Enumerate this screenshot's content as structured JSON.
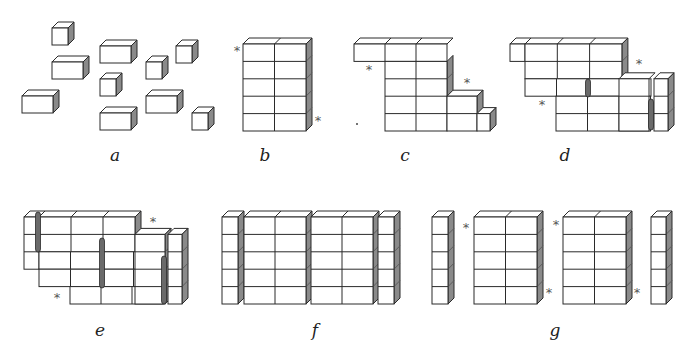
{
  "style": {
    "stroke": "#2a2a2a",
    "face": "#ffffff",
    "top": "#ffffff",
    "side": "#8a8a8a",
    "side_dark": "#5c5c5c",
    "rod": "#6a6a6a",
    "depth_dx": 6,
    "depth_dy": 6,
    "cell_w": 31,
    "cell_h": 17.4
  },
  "panels": [
    {
      "id": "a",
      "label": "a",
      "label_pos": [
        115,
        155
      ]
    },
    {
      "id": "b",
      "label": "b",
      "label_pos": [
        265,
        155
      ]
    },
    {
      "id": "c",
      "label": "c",
      "label_pos": [
        405,
        155
      ]
    },
    {
      "id": "d",
      "label": "d",
      "label_pos": [
        565,
        155
      ]
    },
    {
      "id": "e",
      "label": "e",
      "label_pos": [
        100,
        330
      ]
    },
    {
      "id": "f",
      "label": "f",
      "label_pos": [
        315,
        330
      ]
    },
    {
      "id": "g",
      "label": "g",
      "label_pos": [
        555,
        330
      ]
    }
  ],
  "loose_boxes_a": [
    {
      "x": 52,
      "y": 28,
      "w": 16,
      "h": 17
    },
    {
      "x": 100,
      "y": 46,
      "w": 31,
      "h": 17
    },
    {
      "x": 176,
      "y": 46,
      "w": 16,
      "h": 17
    },
    {
      "x": 52,
      "y": 62,
      "w": 31,
      "h": 17
    },
    {
      "x": 146,
      "y": 62,
      "w": 16,
      "h": 17
    },
    {
      "x": 100,
      "y": 79,
      "w": 16,
      "h": 17
    },
    {
      "x": 22,
      "y": 96,
      "w": 31,
      "h": 17
    },
    {
      "x": 146,
      "y": 96,
      "w": 31,
      "h": 17
    },
    {
      "x": 100,
      "y": 113,
      "w": 31,
      "h": 17
    },
    {
      "x": 192,
      "y": 113,
      "w": 16,
      "h": 17
    }
  ],
  "blocks": {
    "b": [
      {
        "x": 243,
        "y": 44,
        "cols": 2,
        "rows": 5,
        "cw": 31.5,
        "ch": 17.4
      }
    ],
    "c": [
      {
        "x": 354,
        "y": 44,
        "cols": 3,
        "rows": 1,
        "cw": 31,
        "ch": 17.4,
        "noside": true
      },
      {
        "x": 385,
        "y": 61.4,
        "cols": 2,
        "rows": 4,
        "cw": 31,
        "ch": 17.4,
        "notop": true
      },
      {
        "x": 447,
        "y": 96.2,
        "cols": 1,
        "rows": 2,
        "cw": 30,
        "ch": 17.4
      },
      {
        "x": 477,
        "y": 113.6,
        "cols": 1,
        "rows": 1,
        "cw": 13,
        "ch": 17.4
      }
    ],
    "d": [
      {
        "x": 510,
        "y": 44,
        "cols": 1,
        "rows": 1,
        "cw": 15,
        "ch": 17.4,
        "noside": true
      },
      {
        "x": 525,
        "y": 44,
        "cols": 3,
        "rows": 2,
        "cw": 32.3,
        "ch": 17.4
      },
      {
        "x": 525,
        "y": 78.8,
        "cols": 4,
        "rows": 1,
        "cw": 31.5,
        "ch": 17.4,
        "notop": true,
        "noside": true
      },
      {
        "x": 556,
        "y": 96.2,
        "cols": 3,
        "rows": 2,
        "cw": 31.5,
        "ch": 17.4,
        "notop": true,
        "noside": true
      },
      {
        "x": 619,
        "y": 78.8,
        "cols": 1,
        "rows": 3,
        "cw": 30,
        "ch": 17.4,
        "noside": true
      },
      {
        "x": 654,
        "y": 78.8,
        "cols": 1,
        "rows": 3,
        "cw": 14,
        "ch": 17.4
      }
    ],
    "e": [
      {
        "x": 24,
        "y": 217,
        "cols": 1,
        "rows": 3,
        "cw": 15,
        "ch": 17.4,
        "noside": true
      },
      {
        "x": 39,
        "y": 217,
        "cols": 3,
        "rows": 2,
        "cw": 32,
        "ch": 17.4
      },
      {
        "x": 39,
        "y": 251.8,
        "cols": 4,
        "rows": 1,
        "cw": 31.5,
        "ch": 17.4,
        "notop": true,
        "noside": true
      },
      {
        "x": 39,
        "y": 269.2,
        "cols": 4,
        "rows": 1,
        "cw": 31.5,
        "ch": 17.4,
        "notop": true,
        "noside": true
      },
      {
        "x": 70,
        "y": 286.6,
        "cols": 3,
        "rows": 1,
        "cw": 31,
        "ch": 17.4,
        "notop": true,
        "noside": true
      },
      {
        "x": 135,
        "y": 234.4,
        "cols": 1,
        "rows": 4,
        "cw": 30,
        "ch": 17.4
      },
      {
        "x": 168,
        "y": 234.4,
        "cols": 1,
        "rows": 4,
        "cw": 14,
        "ch": 17.4
      }
    ],
    "f": [
      {
        "x": 222,
        "y": 217,
        "cols": 1,
        "rows": 5,
        "cw": 16,
        "ch": 17.4
      },
      {
        "x": 244,
        "y": 217,
        "cols": 2,
        "rows": 5,
        "cw": 31,
        "ch": 17.4
      },
      {
        "x": 311,
        "y": 217,
        "cols": 2,
        "rows": 5,
        "cw": 31,
        "ch": 17.4
      },
      {
        "x": 378,
        "y": 217,
        "cols": 1,
        "rows": 5,
        "cw": 16,
        "ch": 17.4
      }
    ],
    "g": [
      {
        "x": 432,
        "y": 217,
        "cols": 1,
        "rows": 5,
        "cw": 16,
        "ch": 17.4
      },
      {
        "x": 474,
        "y": 217,
        "cols": 2,
        "rows": 5,
        "cw": 31.5,
        "ch": 17.4
      },
      {
        "x": 563,
        "y": 217,
        "cols": 2,
        "rows": 5,
        "cw": 31.5,
        "ch": 17.4
      },
      {
        "x": 651,
        "y": 217,
        "cols": 1,
        "rows": 5,
        "cw": 15,
        "ch": 17.4
      }
    ]
  },
  "rods": [
    {
      "panel": "d",
      "x": 588,
      "y1": 79,
      "y2": 97
    },
    {
      "panel": "d",
      "x": 651,
      "y1": 99,
      "y2": 130
    },
    {
      "panel": "e",
      "x": 38,
      "y1": 212,
      "y2": 252
    },
    {
      "panel": "e",
      "x": 102,
      "y1": 238,
      "y2": 288
    },
    {
      "panel": "e",
      "x": 164,
      "y1": 256,
      "y2": 304
    }
  ],
  "asterisks": [
    {
      "panel": "b",
      "x": 237,
      "y": 50,
      "glyph": "*"
    },
    {
      "panel": "b",
      "x": 318,
      "y": 120,
      "glyph": "*"
    },
    {
      "panel": "c",
      "x": 369,
      "y": 69,
      "glyph": "*"
    },
    {
      "panel": "c",
      "x": 467,
      "y": 82,
      "glyph": "*"
    },
    {
      "panel": "d",
      "x": 639,
      "y": 63,
      "glyph": "*"
    },
    {
      "panel": "d",
      "x": 542,
      "y": 104,
      "glyph": "*"
    },
    {
      "panel": "e",
      "x": 153,
      "y": 221,
      "glyph": "*"
    },
    {
      "panel": "e",
      "x": 57,
      "y": 297,
      "glyph": "*"
    },
    {
      "panel": "g",
      "x": 466,
      "y": 227,
      "glyph": "*"
    },
    {
      "panel": "g",
      "x": 549,
      "y": 292,
      "glyph": "*"
    },
    {
      "panel": "g",
      "x": 556,
      "y": 224,
      "glyph": "*"
    },
    {
      "panel": "g",
      "x": 637,
      "y": 292,
      "glyph": "*"
    }
  ],
  "dots": [
    {
      "panel": "c",
      "x": 356,
      "y": 123
    }
  ]
}
